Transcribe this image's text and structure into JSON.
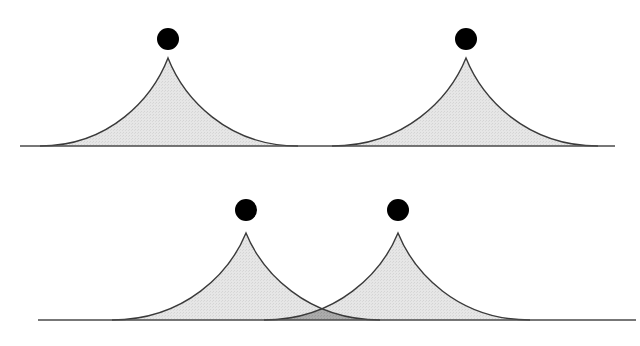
{
  "diagram": {
    "colors": {
      "background": "#ffffff",
      "peak_fill": "#e3e3e3",
      "overlap_fill": "#a8a8a8",
      "outline": "#3a3a3a",
      "dot": "#000000",
      "baseline": "#4a4a4a"
    },
    "panels": [
      {
        "name": "separated",
        "baseline": {
          "y": 146,
          "x1": 20,
          "x2": 615
        },
        "peaks": [
          {
            "center_x": 168,
            "apex_y": 58,
            "left_x": 40,
            "right_x": 298,
            "dot": {
              "cx": 168,
              "cy": 39,
              "r": 11
            }
          },
          {
            "center_x": 466,
            "apex_y": 58,
            "left_x": 332,
            "right_x": 598,
            "dot": {
              "cx": 466,
              "cy": 39,
              "r": 11
            }
          }
        ]
      },
      {
        "name": "overlapping",
        "baseline": {
          "y": 320,
          "x1": 38,
          "x2": 636
        },
        "peaks": [
          {
            "center_x": 246,
            "apex_y": 233,
            "left_x": 112,
            "right_x": 380,
            "dot": {
              "cx": 246,
              "cy": 210,
              "r": 11
            }
          },
          {
            "center_x": 398,
            "apex_y": 233,
            "left_x": 264,
            "right_x": 530,
            "dot": {
              "cx": 398,
              "cy": 210,
              "r": 11
            }
          }
        ],
        "overlap": {
          "intersection_x": 322,
          "intersection_y": 306
        }
      }
    ]
  }
}
